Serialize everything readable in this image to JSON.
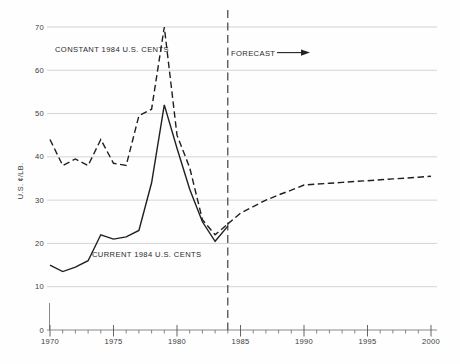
{
  "colors": {
    "line": "#1f1f1f",
    "grid": "#c9c9c9",
    "axis": "#8a8a8a",
    "tick": "#555555",
    "divider": "#2f2f2f",
    "text": "#2a2a2a"
  },
  "labels": {
    "constant_series": "CONSTANT 1984 U.S. CENTS",
    "current_series": "CURRENT 1984 U.S. CENTS",
    "forecast": "FORECAST",
    "y_axis_title": "U.S. ¢/LB."
  },
  "chart_data": {
    "type": "line",
    "title": "",
    "xlabel": "",
    "ylabel": "U.S. ¢/LB.",
    "xlim": [
      1970,
      2000
    ],
    "ylim": [
      0,
      70
    ],
    "y_ticks": [
      0,
      10,
      20,
      30,
      40,
      50,
      60,
      70
    ],
    "x_major_ticks": [
      1970,
      1975,
      1980,
      1985,
      1990,
      1995,
      2000
    ],
    "x_minor_tick_interval": 1,
    "grid": "horizontal",
    "legend_position": "inline-annotations",
    "forecast_divider_x": 1984,
    "annotations": [
      {
        "text": "CONSTANT 1984 U.S. CENTS",
        "near": [
          1974,
          65
        ]
      },
      {
        "text": "FORECAST",
        "near": [
          1984.5,
          64
        ],
        "arrow": "right"
      },
      {
        "text": "CURRENT 1984 U.S. CENTS",
        "near": [
          1973.5,
          17
        ]
      }
    ],
    "series": [
      {
        "name": "CONSTANT 1984 U.S. CENTS",
        "style": "dashed",
        "segment": "historical",
        "x": [
          1970,
          1971,
          1972,
          1973,
          1974,
          1975,
          1976,
          1977,
          1978,
          1979,
          1980,
          1981,
          1982,
          1983,
          1984
        ],
        "values": [
          44,
          38,
          39.5,
          38,
          44,
          38.5,
          38,
          49.5,
          51,
          70,
          45,
          37.5,
          25.5,
          22,
          24.5
        ]
      },
      {
        "name": "CURRENT 1984 U.S. CENTS",
        "style": "solid",
        "segment": "historical",
        "x": [
          1970,
          1971,
          1972,
          1973,
          1974,
          1975,
          1976,
          1977,
          1978,
          1979,
          1980,
          1981,
          1982,
          1983,
          1984
        ],
        "values": [
          15,
          13.5,
          14.5,
          16,
          22,
          21,
          21.5,
          23,
          34,
          52,
          42,
          32.5,
          25,
          20.5,
          24
        ]
      },
      {
        "name": "CONSTANT 1984 U.S. CENTS (FORECAST)",
        "style": "dashed",
        "segment": "forecast",
        "x": [
          1984,
          1985,
          1986,
          1987,
          1988,
          1989,
          1990,
          1991,
          1992,
          1993,
          1994,
          1995,
          1996,
          1997,
          1998,
          1999,
          2000
        ],
        "values": [
          24.5,
          27,
          28.5,
          30,
          31.2,
          32.3,
          33.5,
          33.7,
          33.9,
          34.1,
          34.3,
          34.5,
          34.7,
          34.9,
          35.1,
          35.3,
          35.5
        ]
      }
    ]
  }
}
